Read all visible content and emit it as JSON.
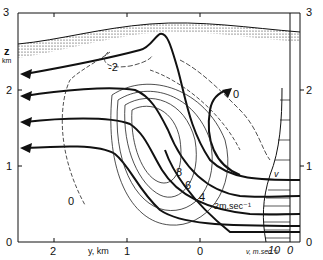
{
  "figure": {
    "type": "atmospheric cross-section diagram",
    "left_axis": {
      "label_top": "z",
      "label_unit": "km",
      "ticks": [
        "3",
        "2",
        "1",
        "0"
      ]
    },
    "right_axis": {
      "ticks": [
        "3",
        "2",
        "1",
        "0"
      ]
    },
    "bottom_axis": {
      "label": "y, km",
      "ticks": [
        "2",
        "1",
        "0"
      ]
    },
    "velocity_axis": {
      "label": "v, m.sec⁻¹",
      "ticks": [
        "10",
        "0"
      ]
    },
    "profile_label": "v",
    "contour_labels": [
      "-2",
      "0",
      "0",
      "8",
      "6",
      "4",
      "2m.sec⁻¹"
    ],
    "contour_unit": "m.sec⁻¹",
    "colors": {
      "ink": "#111111",
      "background": "#ffffff"
    }
  }
}
